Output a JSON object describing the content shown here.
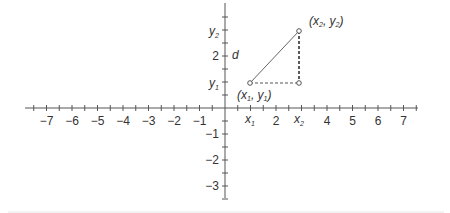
{
  "diagram": {
    "type": "coordinate-plane-distance",
    "x_axis": {
      "ticks": [
        "-7",
        "-6",
        "-5",
        "-4",
        "-3",
        "-2",
        "-1",
        "2",
        "4",
        "5",
        "6",
        "7"
      ],
      "tick_values": [
        -7,
        -6,
        -5,
        -4,
        -3,
        -2,
        -1,
        2,
        4,
        5,
        6,
        7
      ],
      "var_labels": [
        {
          "main": "x",
          "sub": "1",
          "value": 1
        },
        {
          "main": "x",
          "sub": "2",
          "value": 3
        }
      ]
    },
    "y_axis": {
      "ticks": [
        "2",
        "-1",
        "-2",
        "-3"
      ],
      "tick_values": [
        2,
        -1,
        -2,
        -3
      ],
      "var_labels": [
        {
          "main": "y",
          "sub": "1",
          "value": 1
        },
        {
          "main": "y",
          "sub": "2",
          "value": 3
        }
      ]
    },
    "points": [
      {
        "label_prefix": "(",
        "x": "x",
        "xsub": "1",
        "sep": ", ",
        "y": "y",
        "ysub": "1",
        "label_suffix": ")",
        "coord": [
          1,
          1
        ]
      },
      {
        "label_prefix": "(",
        "x": "x",
        "xsub": "2",
        "sep": ", ",
        "y": "y",
        "ysub": "2",
        "label_suffix": ")",
        "coord": [
          2.9,
          3
        ]
      }
    ],
    "distance_label": "d",
    "colors": {
      "axis": "#555555",
      "segment": "#555555",
      "text": "#333333"
    }
  }
}
